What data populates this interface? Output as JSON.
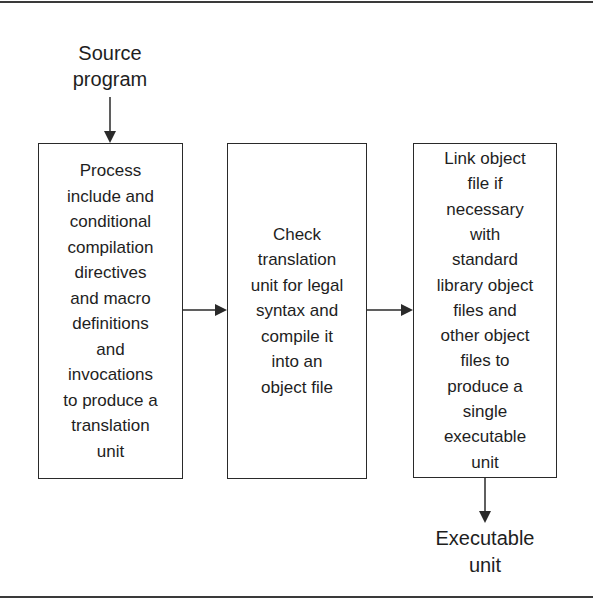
{
  "diagram": {
    "type": "flowchart",
    "direction": "left-to-right",
    "source_label": "Source\nprogram",
    "output_label": "Executable\nunit",
    "steps": [
      {
        "id": "preprocess",
        "text": "Process\ninclude and\nconditional\ncompilation\ndirectives\nand macro\ndefinitions\nand\ninvocations\nto produce a\ntranslation\nunit"
      },
      {
        "id": "compile",
        "text": "Check\ntranslation\nunit for legal\nsyntax and\ncompile it\ninto an\nobject file"
      },
      {
        "id": "link",
        "text": "Link object\nfile if\nnecessary\nwith\nstandard\nlibrary object\nfiles and\nother object\nfiles to\nproduce a\nsingle\nexecutable\nunit"
      }
    ],
    "edges": [
      {
        "from": "source",
        "to": "preprocess"
      },
      {
        "from": "preprocess",
        "to": "compile"
      },
      {
        "from": "compile",
        "to": "link"
      },
      {
        "from": "link",
        "to": "output"
      }
    ],
    "colors": {
      "line": "#2a2a2a",
      "text": "#1e1e1e",
      "background": "#ffffff"
    }
  }
}
